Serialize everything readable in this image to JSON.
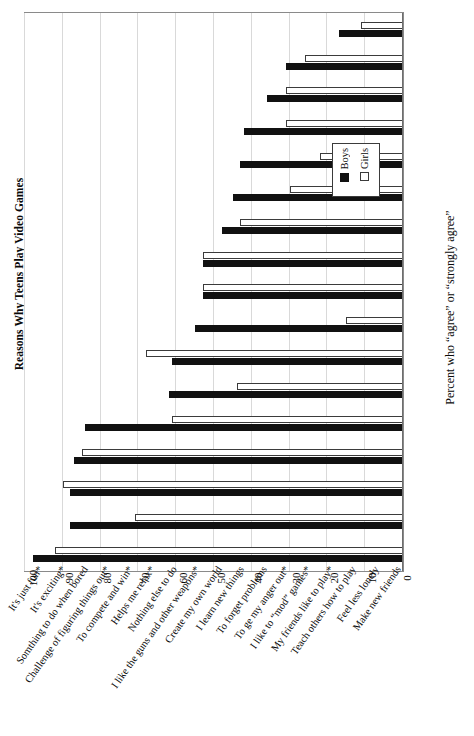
{
  "chart_data": {
    "type": "bar",
    "title": "Reasons Why Teens Play Video Games",
    "xlabel": "",
    "ylabel": "Percent who “agree” or “strongly agree”",
    "orientation": "vertical-bars-rotated-90",
    "ylim": [
      0,
      100
    ],
    "yticks": [
      0,
      10,
      20,
      30,
      40,
      50,
      60,
      70,
      80,
      90,
      100
    ],
    "grid": true,
    "legend_position": "upper-right-inside",
    "categories": [
      "It's just fun*",
      "It's exciting*",
      "Somthing to do when bored",
      "Challenge of figuring things out*",
      "To compete and win*",
      "Helps me relax*",
      "Nothing else to do",
      "I like the guns and other weapons*",
      "Create my own world",
      "I learn new things",
      "To forget problems",
      "To ge my anger out*",
      "I like to “mod” games*",
      "My friends like to play*",
      "Teach others how to play",
      "Feel less lonely",
      "Make new friends"
    ],
    "series": [
      {
        "name": "Boys",
        "color": "#111111",
        "values": [
          98,
          88,
          88,
          87,
          84,
          62,
          61,
          55,
          53,
          53,
          48,
          45,
          43,
          42,
          36,
          31,
          17
        ]
      },
      {
        "name": "Girls",
        "color": "#ffffff",
        "values": [
          92,
          71,
          90,
          85,
          61,
          44,
          68,
          15,
          53,
          53,
          43,
          30,
          22,
          31,
          31,
          26,
          11
        ]
      }
    ],
    "footnote_marker": "*"
  },
  "legend": {
    "items": [
      {
        "label": "Boys",
        "swatch": "filled-black"
      },
      {
        "label": "Girls",
        "swatch": "open-white"
      }
    ]
  },
  "axis": {
    "tick_labels": [
      "0",
      "10",
      "20",
      "30",
      "40",
      "50",
      "60",
      "70",
      "80",
      "90",
      "100"
    ]
  }
}
